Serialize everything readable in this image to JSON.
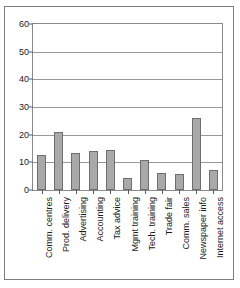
{
  "chart_data": {
    "type": "bar",
    "title": "",
    "subtitle": "",
    "xlabel": "",
    "ylabel": "",
    "ylim": [
      0,
      60
    ],
    "yticks": [
      0,
      10,
      20,
      30,
      40,
      50,
      60
    ],
    "grid": true,
    "legend": false,
    "legend_position": "none",
    "bar_color": "#a9a9a9",
    "bar_edge_color": "#6e6e6e",
    "categories": [
      "Comm. centres",
      "Prod. delivery",
      "Advertising",
      "Accounting",
      "Tax advice",
      "Mgmt training",
      "Tech. training",
      "Trade fair",
      "Comm. sales",
      "Newspaper info",
      "Internet access"
    ],
    "values": [
      12.5,
      21,
      13.3,
      14,
      14.5,
      4.3,
      11,
      6.2,
      5.8,
      26,
      7.3
    ]
  }
}
